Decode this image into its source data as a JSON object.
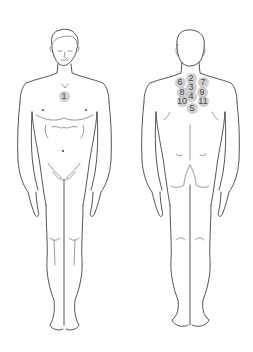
{
  "diagram": {
    "type": "anatomical-body-chart",
    "views": [
      {
        "id": "front",
        "label": "",
        "markers": [
          {
            "label": "1",
            "x": 64,
            "y": 96
          }
        ]
      },
      {
        "id": "back",
        "label": "",
        "markers": [
          {
            "label": "2",
            "x": 191,
            "y": 78
          },
          {
            "label": "6",
            "x": 180,
            "y": 82
          },
          {
            "label": "7",
            "x": 203,
            "y": 82
          },
          {
            "label": "3",
            "x": 191,
            "y": 87
          },
          {
            "label": "8",
            "x": 182,
            "y": 92
          },
          {
            "label": "9",
            "x": 202,
            "y": 92
          },
          {
            "label": "4",
            "x": 191,
            "y": 96
          },
          {
            "label": "10",
            "x": 182,
            "y": 101
          },
          {
            "label": "11",
            "x": 203,
            "y": 101
          },
          {
            "label": "5",
            "x": 192,
            "y": 108
          }
        ]
      }
    ],
    "colors": {
      "line": "#2a2a2a",
      "marker_fill": "#aaaaaa",
      "marker_text": "#4a4a4a",
      "background": "#ffffff"
    }
  }
}
